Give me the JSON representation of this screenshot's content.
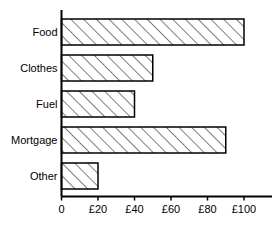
{
  "chart_data": {
    "type": "bar",
    "orientation": "horizontal",
    "title": "",
    "xlabel": "",
    "ylabel": "",
    "categories": [
      "Food",
      "Clothes",
      "Fuel",
      "Mortgage",
      "Other"
    ],
    "values": [
      100,
      50,
      40,
      90,
      20
    ],
    "value_prefix": "£",
    "xlim": [
      0,
      120
    ],
    "xticks": [
      0,
      20,
      40,
      60,
      80,
      100
    ],
    "xtick_labels": [
      "0",
      "£20",
      "£40",
      "£60",
      "£80",
      "£100"
    ],
    "grid": false,
    "legend": null,
    "bar_style": {
      "fill": "#ffffff",
      "edge": "#000000",
      "hatch": "/",
      "hatch_color": "#000000"
    },
    "axis_color": "#000000"
  }
}
